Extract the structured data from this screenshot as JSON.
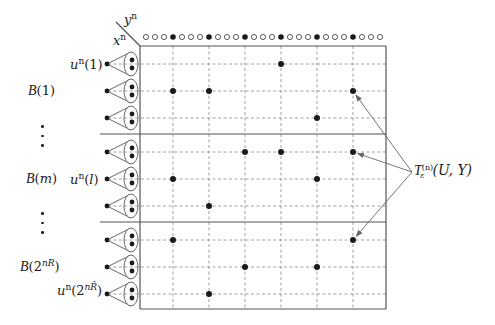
{
  "diagram": {
    "axis_labels": {
      "rows": "x",
      "rows_sup": "n",
      "cols": "y",
      "cols_sup": "n"
    },
    "colors": {
      "line": "#555555",
      "dash": "#888888",
      "dot": "#1a1a1a",
      "arrow": "#666666"
    },
    "top_sequence": {
      "pattern": [
        "open",
        "open",
        "open",
        "filled",
        "open",
        "open",
        "open",
        "filled",
        "open",
        "open",
        "open",
        "filled",
        "open",
        "open",
        "open",
        "filled",
        "open",
        "open",
        "open",
        "filled",
        "open",
        "open",
        "open",
        "filled",
        "open",
        "open",
        "open"
      ],
      "description": "y^n sequences; filled circles align with grid columns"
    },
    "bins": [
      {
        "name": "B(1)",
        "label_prefix": "B",
        "label_arg": "1",
        "rows": [
          0,
          1,
          2
        ]
      },
      {
        "name": "B(m)",
        "label_prefix": "B",
        "label_arg": "m",
        "rows": [
          3,
          4,
          5
        ]
      },
      {
        "name": "B(2^{nR})",
        "label_prefix": "B",
        "label_arg_base": "2",
        "label_arg_sup": "nR",
        "rows": [
          6,
          7,
          8
        ]
      }
    ],
    "codeword_labels": [
      {
        "row": 0,
        "prefix": "u",
        "sup": "n",
        "arg": "1"
      },
      {
        "row": 4,
        "prefix": "u",
        "sup": "n",
        "arg": "l"
      },
      {
        "row": 8,
        "prefix": "u",
        "sup": "n",
        "arg_base": "2",
        "arg_sup": "nR̃"
      }
    ],
    "columns_count": 6,
    "rows_count": 9,
    "typical_points": [
      {
        "row": 0,
        "col": 3
      },
      {
        "row": 1,
        "col": 0
      },
      {
        "row": 1,
        "col": 1
      },
      {
        "row": 1,
        "col": 5
      },
      {
        "row": 2,
        "col": 4
      },
      {
        "row": 3,
        "col": 2
      },
      {
        "row": 3,
        "col": 3
      },
      {
        "row": 3,
        "col": 5
      },
      {
        "row": 4,
        "col": 0
      },
      {
        "row": 4,
        "col": 4
      },
      {
        "row": 5,
        "col": 1
      },
      {
        "row": 6,
        "col": 0
      },
      {
        "row": 6,
        "col": 5
      },
      {
        "row": 7,
        "col": 2
      },
      {
        "row": 7,
        "col": 4
      },
      {
        "row": 8,
        "col": 1
      }
    ],
    "annotation": {
      "text": "T_ε^(n)(U, Y)",
      "symbol": "T",
      "sub": "ε",
      "sup": "(n)",
      "args": "(U, Y)",
      "arrow_targets": [
        {
          "row": 1,
          "col": 5
        },
        {
          "row": 3,
          "col": 5
        },
        {
          "row": 6,
          "col": 5
        }
      ]
    },
    "ellipsis": "⋮"
  }
}
